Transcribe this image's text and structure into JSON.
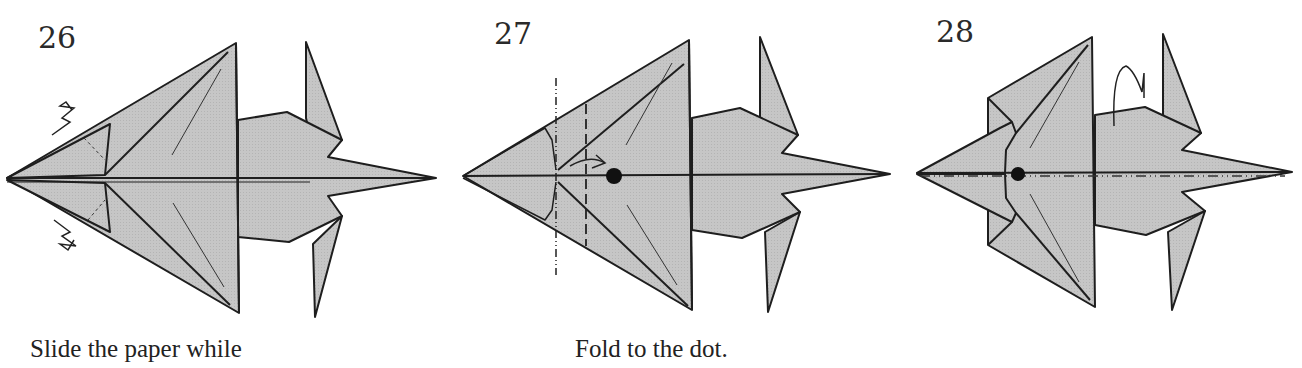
{
  "steps": [
    {
      "number": "26",
      "caption": "Slide the paper while",
      "symbols": [
        "sink-arrow-top",
        "sink-arrow-bottom",
        "hidden-fold-dashed-lines"
      ]
    },
    {
      "number": "27",
      "caption": "Fold to the dot.",
      "symbols": [
        "mountain-fold-line",
        "valley-fold-line",
        "fold-arrow",
        "target-dot"
      ]
    },
    {
      "number": "28",
      "caption": "",
      "symbols": [
        "target-dot",
        "mountain-fold-centerline",
        "turn-over-arrow"
      ]
    }
  ],
  "colors": {
    "paper": "#c3c3c3",
    "line": "#1e1e1e",
    "background": "#ffffff"
  }
}
